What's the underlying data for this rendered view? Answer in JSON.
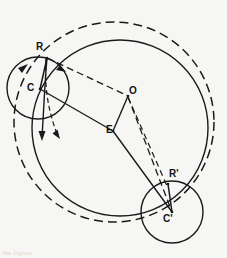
{
  "figure": {
    "background_color": "#f6f6f4",
    "ink_color": "#1a1a1a",
    "labels": [
      {
        "id": "R",
        "text": "R",
        "x": 41,
        "y": 47,
        "point_x": 47,
        "point_y": 58
      },
      {
        "id": "C",
        "text": "C",
        "x": 30,
        "y": 83,
        "point_x": 40,
        "point_y": 89
      },
      {
        "id": "O",
        "text": "O",
        "x": 130,
        "y": 89,
        "point_x": 128,
        "point_y": 96
      },
      {
        "id": "E",
        "text": "E",
        "x": 108,
        "y": 127,
        "point_x": 113,
        "point_y": 131
      },
      {
        "id": "Rp",
        "text": "R'",
        "x": 170,
        "y": 173,
        "point_x": 168,
        "point_y": 184
      },
      {
        "id": "Cp",
        "text": "C'",
        "x": 167,
        "y": 216,
        "point_x": 172,
        "point_y": 212
      }
    ],
    "circles": [
      {
        "id": "outer-dashed-circle",
        "cx": 114,
        "cy": 122,
        "r": 100,
        "style": "dashed"
      },
      {
        "id": "large-solid-circle",
        "cx": 120,
        "cy": 128,
        "r": 88,
        "style": "solid"
      },
      {
        "id": "small-circle-c",
        "cx": 38,
        "cy": 88,
        "r": 31,
        "style": "solid"
      },
      {
        "id": "small-circle-cprime",
        "cx": 172,
        "cy": 212,
        "r": 31,
        "style": "solid"
      }
    ],
    "segments": [
      {
        "id": "R-C",
        "style": "solid",
        "x1": 47,
        "y1": 58,
        "x2": 40,
        "y2": 89
      },
      {
        "id": "C-E",
        "style": "solid",
        "x1": 40,
        "y1": 89,
        "x2": 113,
        "y2": 131
      },
      {
        "id": "E-O",
        "style": "solid",
        "x1": 113,
        "y1": 131,
        "x2": 128,
        "y2": 96
      },
      {
        "id": "R-O",
        "style": "dashed",
        "x1": 47,
        "y1": 58,
        "x2": 128,
        "y2": 96
      },
      {
        "id": "O-Rp",
        "style": "dashed",
        "x1": 128,
        "y1": 96,
        "x2": 168,
        "y2": 184
      },
      {
        "id": "E-Cp",
        "style": "solid",
        "x1": 113,
        "y1": 131,
        "x2": 172,
        "y2": 212
      },
      {
        "id": "Rp-Cp",
        "style": "solid",
        "x1": 168,
        "y1": 184,
        "x2": 172,
        "y2": 212
      },
      {
        "id": "O-Cp",
        "style": "dashed",
        "x1": 128,
        "y1": 96,
        "x2": 172,
        "y2": 212
      }
    ],
    "arrows": [
      {
        "id": "arc-arrow-c",
        "description": "arrowhead on rolling circle arc at C, counter-clockwise"
      },
      {
        "id": "down-arrow-solid",
        "description": "arrowhead on descending solid trace below C"
      },
      {
        "id": "down-arrow-dashed",
        "description": "arrowhead on descending dashed trace below C"
      },
      {
        "id": "arrow-to-o",
        "description": "arrowhead on dashed chord R to O"
      }
    ]
  },
  "footer": {
    "cut_text": "the figure"
  }
}
